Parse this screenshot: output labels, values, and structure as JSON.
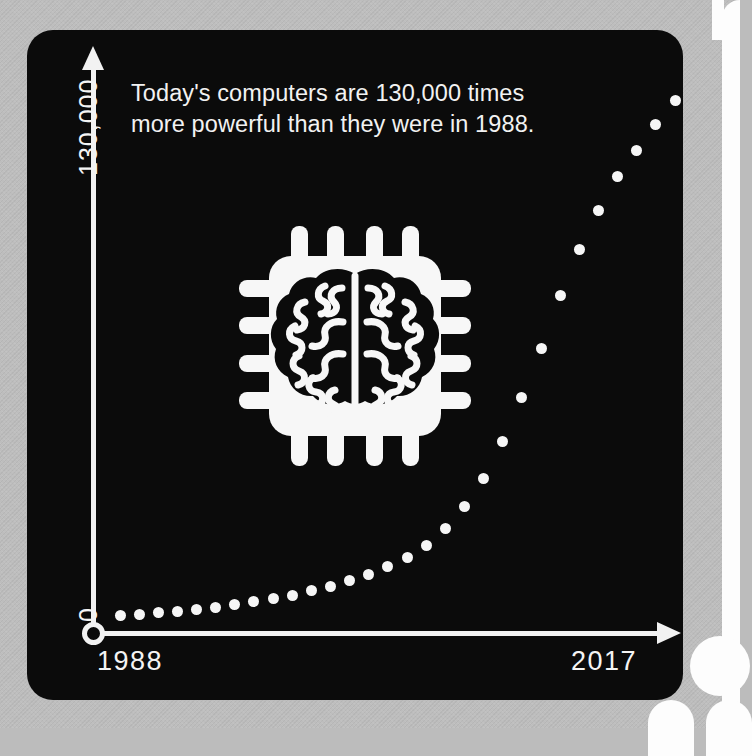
{
  "background": {
    "color": "#bcbcbc",
    "page_edge_color": "#fdfdfd"
  },
  "card": {
    "background_color": "#0b0b0b",
    "foreground_color": "#f2f2f2"
  },
  "headline": {
    "line1": "Today's computers are 130,000 times",
    "line2": "more powerful than they were in 1988."
  },
  "icon": {
    "name": "brain-chip-icon",
    "label": "Brain microchip"
  },
  "axes": {
    "y_max_label": "130,000",
    "y_min_label": "0",
    "x_start_label": "1988",
    "x_end_label": "2017"
  },
  "chart_data": {
    "type": "scatter",
    "title": "Today's computers are 130,000 times more powerful than they were in 1988.",
    "subtitle": "",
    "xlabel": "",
    "ylabel": "",
    "grid": false,
    "legend": null,
    "xlim": [
      1988,
      2017
    ],
    "ylim": [
      0,
      130000
    ],
    "x_tick_labels": [
      "1988",
      "2017"
    ],
    "y_tick_labels": [
      "0",
      "130,000"
    ],
    "annotations": [
      "130,000 times more powerful"
    ],
    "marker": {
      "shape": "circle",
      "color": "#f6f6f6",
      "size": 11
    },
    "note": "Exponential growth of relative computing power, doubling roughly every 2 years (Moore's Law).",
    "x": [
      1988,
      1989,
      1990,
      1991,
      1992,
      1993,
      1994,
      1995,
      1996,
      1997,
      1998,
      1999,
      2000,
      2001,
      2002,
      2003,
      2004,
      2005,
      2006,
      2007,
      2008,
      2009,
      2010,
      2011,
      2012,
      2013,
      2014,
      2015,
      2016,
      2017
    ],
    "y": [
      1,
      1.5,
      2,
      3,
      4,
      6,
      9,
      13,
      19,
      28,
      41,
      60,
      88,
      129,
      190,
      279,
      410,
      602,
      884,
      1298,
      1906,
      2800,
      4112,
      6039,
      8868,
      13024,
      19125,
      28087,
      41247,
      130000
    ],
    "y_normalized_percent": [
      0.6,
      0.9,
      1.2,
      1.5,
      1.9,
      2.3,
      2.8,
      3.3,
      3.9,
      4.6,
      5.4,
      6.3,
      7.3,
      8.5,
      10.0,
      11.8,
      14.2,
      17.3,
      21.5,
      27.0,
      34.0,
      42.5,
      52.0,
      62.0,
      71.0,
      78.5,
      85.0,
      90.0,
      95.0,
      99.5
    ]
  }
}
